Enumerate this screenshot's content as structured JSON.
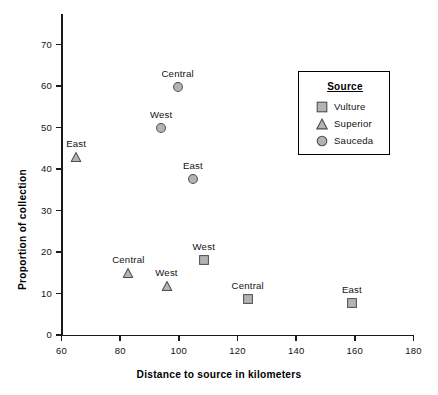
{
  "chart_data": {
    "type": "scatter",
    "title": "",
    "xlabel": "Distance to source in kilometers",
    "ylabel": "Proportion of collection",
    "xlim": [
      60,
      180
    ],
    "ylim": [
      0,
      78
    ],
    "xticks": [
      60,
      80,
      100,
      120,
      140,
      160,
      180
    ],
    "yticks": [
      0,
      10,
      20,
      30,
      40,
      50,
      60,
      70
    ],
    "grid": false,
    "legend": {
      "title": "Source",
      "position": "upper-right",
      "entries": [
        {
          "name": "Vulture",
          "marker": "square",
          "fill": "#b3b3b3",
          "stroke": "#4d4d4d"
        },
        {
          "name": "Superior",
          "marker": "triangle",
          "fill": "#b3b3b3",
          "stroke": "#4d4d4d"
        },
        {
          "name": "Sauceda",
          "marker": "circle",
          "fill": "#b3b3b3",
          "stroke": "#4d4d4d"
        }
      ]
    },
    "series": [
      {
        "name": "Vulture",
        "marker": "square",
        "points": [
          {
            "label": "West",
            "x": 108.5,
            "y": 18.1
          },
          {
            "label": "Central",
            "x": 123.5,
            "y": 8.7
          },
          {
            "label": "East",
            "x": 159.0,
            "y": 7.6
          }
        ]
      },
      {
        "name": "Superior",
        "marker": "triangle",
        "points": [
          {
            "label": "East",
            "x": 65.0,
            "y": 43.0
          },
          {
            "label": "Central",
            "x": 82.8,
            "y": 14.9
          },
          {
            "label": "West",
            "x": 95.8,
            "y": 11.8
          }
        ]
      },
      {
        "name": "Sauceda",
        "marker": "circle",
        "points": [
          {
            "label": "Central",
            "x": 99.6,
            "y": 59.8
          },
          {
            "label": "West",
            "x": 94.0,
            "y": 49.8
          },
          {
            "label": "East",
            "x": 104.8,
            "y": 37.5
          }
        ]
      }
    ]
  }
}
